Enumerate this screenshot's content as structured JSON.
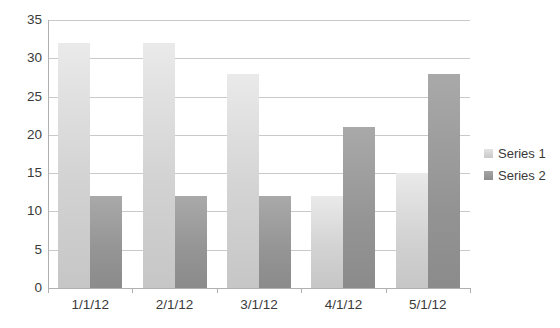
{
  "chart_data": {
    "type": "bar",
    "title": "",
    "subtitle": "",
    "xlabel": "",
    "ylabel": "",
    "categories": [
      "1/1/12",
      "2/1/12",
      "3/1/12",
      "4/1/12",
      "5/1/12"
    ],
    "series": [
      {
        "name": "Series 1",
        "values": [
          32,
          32,
          28,
          12,
          15
        ],
        "color": "#d3d3d3"
      },
      {
        "name": "Series 2",
        "values": [
          12,
          12,
          12,
          21,
          28
        ],
        "color": "#949494"
      }
    ],
    "ylim": [
      0,
      35
    ],
    "ytick_labels": [
      "0",
      "5",
      "10",
      "15",
      "20",
      "25",
      "30",
      "35"
    ],
    "ytick_values": [
      0,
      5,
      10,
      15,
      20,
      25,
      30,
      35
    ],
    "grid": true,
    "grid_axis": "y",
    "legend_position": "right",
    "bar_style": "clustered"
  },
  "legend": {
    "entries": [
      {
        "label": "Series 1"
      },
      {
        "label": "Series 2"
      }
    ]
  },
  "colors": {
    "gridline": "#c9c9c9",
    "axis": "#b0b0b0",
    "text": "#3a3a3a",
    "background": "#ffffff",
    "series1": "#d3d3d3",
    "series2": "#949494"
  }
}
